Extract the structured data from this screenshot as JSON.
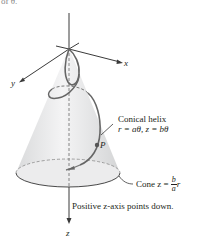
{
  "header_fragment": "of θ.",
  "axes": {
    "x_label": "x",
    "y_label": "y",
    "z_label": "z"
  },
  "labels": {
    "helix_title": "Conical helix",
    "helix_equation": "r = aθ, z = bθ",
    "point_label": "P",
    "cone_prefix": "Cone z =",
    "cone_frac_num": "b",
    "cone_frac_den": "a",
    "cone_suffix": "r",
    "z_direction_note": "Positive z-axis points down."
  },
  "colors": {
    "cone_fill": "#e4e5e6",
    "cone_fill_light": "#f2f2f3",
    "axis": "#3a3a3a",
    "helix": "#6b6b6b",
    "text": "#231f20"
  }
}
